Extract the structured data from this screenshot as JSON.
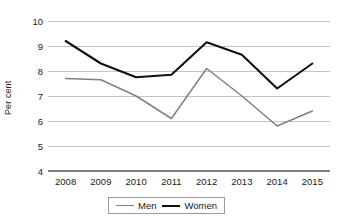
{
  "chart_data": {
    "type": "line",
    "title": "",
    "xlabel": "",
    "ylabel": "Per cent",
    "categories": [
      "2008",
      "2009",
      "2010",
      "2011",
      "2012",
      "2013",
      "2014",
      "2015"
    ],
    "x": [
      2008,
      2009,
      2010,
      2011,
      2012,
      2013,
      2014,
      2015
    ],
    "series": [
      {
        "name": "Men",
        "color": "#808080",
        "values": [
          7.7,
          7.65,
          7.0,
          6.1,
          8.1,
          7.0,
          5.8,
          6.4
        ]
      },
      {
        "name": "Women",
        "color": "#111111",
        "values": [
          9.2,
          8.3,
          7.75,
          7.85,
          9.15,
          8.65,
          7.3,
          8.3
        ]
      }
    ],
    "ylim": [
      4,
      10
    ],
    "yticks": [
      4,
      5,
      6,
      7,
      8,
      9,
      10
    ],
    "ytick_labels": [
      "4",
      "5",
      "6",
      "7",
      "8",
      "9",
      "10"
    ],
    "grid": true,
    "grid_color": "#b5b5b5",
    "axis_color": "#808080",
    "legend_position": "bottom",
    "legend": [
      "Men",
      "Women"
    ]
  },
  "axis": {
    "y_title": "Per cent"
  },
  "legend": {
    "entries": [
      {
        "label": "Men"
      },
      {
        "label": "Women"
      }
    ]
  }
}
